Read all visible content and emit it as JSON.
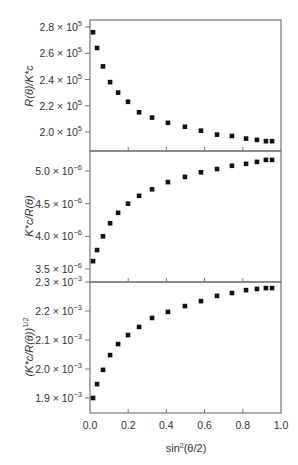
{
  "figure": {
    "x_axis_label": "sin²(θ/2)",
    "x_axis_label_base": "sin",
    "x_axis_label_sup": "2",
    "x_axis_label_rest": "(θ/2)",
    "x_ticks": [
      "0.0",
      "0.2",
      "0.4",
      "0.6",
      "0.8",
      "1.0"
    ],
    "frame_color": "#777777",
    "marker_color": "#111111"
  },
  "chart_data": [
    {
      "type": "scatter",
      "title": "",
      "xlabel": "sin²(θ/2)",
      "ylabel": "R(θ)/K*c",
      "xlim": [
        0.0,
        1.0
      ],
      "ylim": [
        188000.0,
        284000.0
      ],
      "y_ticks": [
        "2.0 × 10⁵",
        "2.2 × 10⁵",
        "2.4 × 10⁵",
        "2.6 × 10⁵",
        "2.8 × 10⁵"
      ],
      "y_tick_values": [
        200000.0,
        220000.0,
        240000.0,
        260000.0,
        280000.0
      ],
      "grid": false,
      "x": [
        0.016,
        0.037,
        0.068,
        0.105,
        0.147,
        0.199,
        0.257,
        0.325,
        0.408,
        0.497,
        0.581,
        0.665,
        0.743,
        0.817,
        0.874,
        0.921,
        0.953
      ],
      "values": [
        276000.0,
        264000.0,
        250000.0,
        238000.0,
        230000.0,
        223000.0,
        215000.0,
        211000.0,
        207000.0,
        204000.0,
        201000.0,
        198000.0,
        197000.0,
        195000.0,
        194000.0,
        193000.0,
        193000.0
      ]
    },
    {
      "type": "scatter",
      "title": "",
      "xlabel": "sin²(θ/2)",
      "ylabel": "K*c/R(θ)",
      "xlim": [
        0.0,
        1.0
      ],
      "ylim": [
        3.35e-06,
        5.3e-06
      ],
      "y_ticks": [
        "3.5 × 10⁻⁶",
        "4.0 × 10⁻⁶",
        "4.5 × 10⁻⁶",
        "5.0 × 10⁻⁶"
      ],
      "y_tick_values": [
        3.5e-06,
        4e-06,
        4.5e-06,
        5e-06
      ],
      "grid": false,
      "x": [
        0.016,
        0.037,
        0.068,
        0.105,
        0.147,
        0.199,
        0.257,
        0.325,
        0.408,
        0.497,
        0.581,
        0.665,
        0.743,
        0.817,
        0.874,
        0.921,
        0.953
      ],
      "values": [
        3.62e-06,
        3.79e-06,
        4e-06,
        4.2e-06,
        4.36e-06,
        4.5e-06,
        4.62e-06,
        4.72e-06,
        4.83e-06,
        4.91e-06,
        4.98e-06,
        5.03e-06,
        5.08e-06,
        5.11e-06,
        5.14e-06,
        5.17e-06,
        5.17e-06
      ]
    },
    {
      "type": "scatter",
      "title": "",
      "xlabel": "sin²(θ/2)",
      "ylabel": "(K*c/R(θ))^1/2",
      "xlim": [
        0.0,
        1.0
      ],
      "ylim": [
        0.001852,
        0.0023
      ],
      "y_ticks": [
        "1.9 × 10⁻³",
        "2.0 × 10⁻³",
        "2.1 × 10⁻³",
        "2.2 × 10⁻³",
        "2.3 × 10⁻³"
      ],
      "y_tick_values": [
        0.0019,
        0.002,
        0.0021,
        0.0022,
        0.0023
      ],
      "grid": false,
      "x": [
        0.016,
        0.037,
        0.068,
        0.105,
        0.147,
        0.199,
        0.257,
        0.325,
        0.408,
        0.497,
        0.581,
        0.665,
        0.743,
        0.817,
        0.874,
        0.921,
        0.953
      ],
      "values": [
        0.0019,
        0.001948,
        0.001997,
        0.002048,
        0.002086,
        0.002117,
        0.002145,
        0.002176,
        0.002197,
        0.002217,
        0.002234,
        0.002252,
        0.002262,
        0.002272,
        0.002276,
        0.002279,
        0.002279
      ]
    }
  ]
}
